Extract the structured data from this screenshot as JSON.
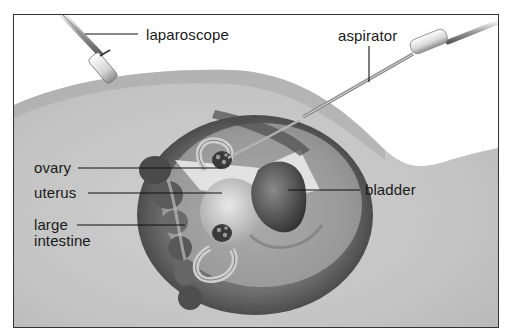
{
  "figure": {
    "title_cut": "…  laparoscopy …",
    "colors": {
      "background": "#ffffff",
      "frame": "#333333",
      "skin_light": "#d9d9d9",
      "skin_mid": "#bdbdbd",
      "cavity_dark": "#555555",
      "organ_dark": "#4a4a4a",
      "label_text": "#1a1a1a"
    }
  },
  "labels": {
    "laparoscope": "laparoscope",
    "aspirator": "aspirator",
    "ovary": "ovary",
    "uterus": "uterus",
    "large_intestine_line1": "large",
    "large_intestine_line2": "intestine",
    "bladder": "bladder"
  },
  "instruments": [
    {
      "name": "laparoscope",
      "side": "upper-left"
    },
    {
      "name": "aspirator",
      "side": "upper-right"
    }
  ],
  "organs": [
    "ovary",
    "uterus",
    "large intestine",
    "bladder"
  ]
}
